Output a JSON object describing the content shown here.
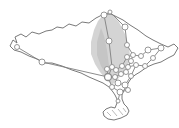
{
  "figure": {
    "width": 179,
    "height": 128,
    "background": "#ffffff",
    "colors": {
      "coastline": "#6a6a6a",
      "edge": "#7f7f7f",
      "node_fill": "#ffffff",
      "node_stroke": "#8c8c8c",
      "shade": "#c9c9c9",
      "shade_inner": "#b5b5b5",
      "hatch": "#9c9c9c"
    },
    "island_outline": [
      [
        10,
        46
      ],
      [
        13,
        40
      ],
      [
        17,
        43
      ],
      [
        15,
        37
      ],
      [
        21,
        34
      ],
      [
        26,
        37
      ],
      [
        32,
        32
      ],
      [
        39,
        34
      ],
      [
        46,
        31
      ],
      [
        52,
        30
      ],
      [
        57,
        27
      ],
      [
        63,
        28
      ],
      [
        69,
        24
      ],
      [
        76,
        26
      ],
      [
        82,
        22
      ],
      [
        89,
        23
      ],
      [
        96,
        18
      ],
      [
        104,
        14
      ],
      [
        111,
        14
      ],
      [
        117,
        17
      ],
      [
        123,
        20
      ],
      [
        130,
        25
      ],
      [
        138,
        30
      ],
      [
        146,
        36
      ],
      [
        153,
        40
      ],
      [
        161,
        44
      ],
      [
        168,
        47
      ],
      [
        174,
        44
      ],
      [
        178,
        48
      ],
      [
        174,
        55
      ],
      [
        168,
        58
      ],
      [
        161,
        62
      ],
      [
        154,
        64
      ],
      [
        147,
        67
      ],
      [
        140,
        72
      ],
      [
        135,
        75
      ],
      [
        130,
        80
      ],
      [
        127,
        85
      ],
      [
        124,
        90
      ],
      [
        122,
        95
      ],
      [
        122,
        99
      ],
      [
        124,
        104
      ],
      [
        127,
        107
      ],
      [
        129,
        111
      ],
      [
        127,
        115
      ],
      [
        121,
        118
      ],
      [
        114,
        120
      ],
      [
        108,
        119
      ],
      [
        104,
        116
      ],
      [
        103,
        112
      ],
      [
        106,
        109
      ],
      [
        111,
        107
      ],
      [
        115,
        108
      ],
      [
        117,
        103
      ],
      [
        117,
        99
      ],
      [
        115,
        95
      ],
      [
        113,
        92
      ],
      [
        109,
        87
      ],
      [
        103,
        83
      ],
      [
        96,
        80
      ],
      [
        89,
        77
      ],
      [
        81,
        73
      ],
      [
        72,
        70
      ],
      [
        62,
        66
      ],
      [
        52,
        63
      ],
      [
        45,
        63
      ],
      [
        37,
        59
      ],
      [
        29,
        56
      ],
      [
        21,
        52
      ],
      [
        14,
        50
      ]
    ],
    "shade_polygon": [
      [
        104,
        14
      ],
      [
        98,
        21
      ],
      [
        94,
        30
      ],
      [
        91,
        42
      ],
      [
        91,
        54
      ],
      [
        95,
        64
      ],
      [
        100,
        72
      ],
      [
        106,
        79
      ],
      [
        112,
        85
      ],
      [
        117,
        80
      ],
      [
        123,
        73
      ],
      [
        128,
        66
      ],
      [
        130,
        56
      ],
      [
        129,
        46
      ],
      [
        125,
        34
      ],
      [
        119,
        22
      ],
      [
        111,
        13
      ]
    ],
    "shade_inner_polygon": [
      [
        101,
        28
      ],
      [
        97,
        42
      ],
      [
        97,
        55
      ],
      [
        101,
        66
      ],
      [
        106,
        74
      ],
      [
        109,
        66
      ],
      [
        107,
        50
      ],
      [
        104,
        36
      ]
    ],
    "hatch_lines": [
      [
        107,
        112,
        111,
        116
      ],
      [
        112,
        110,
        117,
        116
      ],
      [
        118,
        109,
        123,
        115
      ],
      [
        123,
        108,
        126,
        112
      ]
    ],
    "nodes": [
      {
        "id": "w1",
        "x": 17,
        "y": 47,
        "r": 2.5
      },
      {
        "id": "w2",
        "x": 42,
        "y": 62,
        "r": 3
      },
      {
        "id": "a",
        "x": 104,
        "y": 15,
        "r": 3
      },
      {
        "id": "b",
        "x": 110,
        "y": 12,
        "r": 2
      },
      {
        "id": "c",
        "x": 125,
        "y": 27,
        "r": 3
      },
      {
        "id": "d",
        "x": 109,
        "y": 41,
        "r": 3
      },
      {
        "id": "e",
        "x": 127,
        "y": 45,
        "r": 2.5
      },
      {
        "id": "f",
        "x": 127,
        "y": 57,
        "r": 2.5
      },
      {
        "id": "g",
        "x": 133,
        "y": 55,
        "r": 2.5
      },
      {
        "id": "h",
        "x": 122,
        "y": 66,
        "r": 2.5
      },
      {
        "id": "i",
        "x": 128,
        "y": 67,
        "r": 2.5
      },
      {
        "id": "j",
        "x": 136,
        "y": 65,
        "r": 2.5
      },
      {
        "id": "k",
        "x": 131,
        "y": 61,
        "r": 2.5
      },
      {
        "id": "l",
        "x": 141,
        "y": 56,
        "r": 2.5
      },
      {
        "id": "m",
        "x": 148,
        "y": 50,
        "r": 3
      },
      {
        "id": "n",
        "x": 161,
        "y": 48,
        "r": 3
      },
      {
        "id": "o",
        "x": 153,
        "y": 58,
        "r": 2.5
      },
      {
        "id": "q",
        "x": 145,
        "y": 66,
        "r": 2.5
      },
      {
        "id": "r",
        "x": 107,
        "y": 69,
        "r": 2.5
      },
      {
        "id": "s",
        "x": 112,
        "y": 67,
        "r": 2.5
      },
      {
        "id": "t",
        "x": 116,
        "y": 70,
        "r": 2.5
      },
      {
        "id": "u",
        "x": 108,
        "y": 77,
        "r": 3.5
      },
      {
        "id": "v",
        "x": 115,
        "y": 77,
        "r": 2.5
      },
      {
        "id": "w",
        "x": 121,
        "y": 74,
        "r": 2.5
      },
      {
        "id": "x",
        "x": 126,
        "y": 72,
        "r": 2.5
      },
      {
        "id": "y",
        "x": 131,
        "y": 76,
        "r": 2.5
      },
      {
        "id": "z",
        "x": 118,
        "y": 83,
        "r": 3
      },
      {
        "id": "aa",
        "x": 125,
        "y": 85,
        "r": 3
      },
      {
        "id": "ab",
        "x": 112,
        "y": 87,
        "r": 2.5
      },
      {
        "id": "ac",
        "x": 120,
        "y": 92,
        "r": 3
      },
      {
        "id": "ad",
        "x": 128,
        "y": 90,
        "r": 2.5
      },
      {
        "id": "ae",
        "x": 118,
        "y": 101,
        "r": 2
      }
    ],
    "edges": [
      [
        "w1",
        "w2"
      ],
      [
        "w2",
        "u"
      ],
      [
        "a",
        "b"
      ],
      [
        "b",
        "c"
      ],
      [
        "c",
        "e"
      ],
      [
        "e",
        "g"
      ],
      [
        "a",
        "d"
      ],
      [
        "d",
        "s"
      ],
      [
        "r",
        "s"
      ],
      [
        "r",
        "u"
      ],
      [
        "s",
        "u"
      ],
      [
        "s",
        "t"
      ],
      [
        "t",
        "w"
      ],
      [
        "t",
        "h"
      ],
      [
        "f",
        "g"
      ],
      [
        "f",
        "h"
      ],
      [
        "g",
        "k"
      ],
      [
        "k",
        "i"
      ],
      [
        "i",
        "j"
      ],
      [
        "g",
        "l"
      ],
      [
        "l",
        "m"
      ],
      [
        "m",
        "n"
      ],
      [
        "n",
        "o"
      ],
      [
        "o",
        "q"
      ],
      [
        "q",
        "j"
      ],
      [
        "j",
        "y"
      ],
      [
        "u",
        "v"
      ],
      [
        "v",
        "w"
      ],
      [
        "w",
        "x"
      ],
      [
        "x",
        "k"
      ],
      [
        "x",
        "y"
      ],
      [
        "v",
        "z"
      ],
      [
        "u",
        "ab"
      ],
      [
        "z",
        "aa"
      ],
      [
        "aa",
        "y"
      ],
      [
        "aa",
        "ad"
      ],
      [
        "ab",
        "z"
      ],
      [
        "ab",
        "ac"
      ],
      [
        "ac",
        "ad"
      ],
      [
        "ac",
        "ae"
      ]
    ]
  }
}
